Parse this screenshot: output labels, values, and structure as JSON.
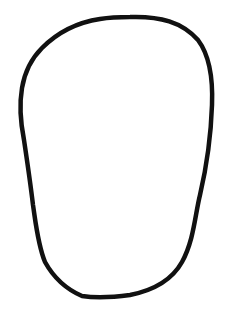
{
  "drawing": {
    "subject": "hand-drawn closed outline shape (egg / face outline)",
    "background_color": "#ffffff",
    "stroke_color": "#111111",
    "stroke_width": 4.5,
    "fill": "none",
    "path": "M 130 17 C 160 16, 182 22, 198 40 C 210 56, 213 80, 212 105 C 211 135, 207 165, 200 195 C 195 215, 194 240, 182 262 C 172 280, 155 290, 130 295 C 115 297, 95 298, 82 296 C 68 290, 55 280, 45 262 C 38 245, 36 225, 33 205 C 30 180, 27 160, 24 140 C 20 120, 20 100, 22 88 C 25 70, 32 58, 42 48 C 60 30, 80 22, 100 19 C 112 17, 122 17, 130 17 Z"
  }
}
